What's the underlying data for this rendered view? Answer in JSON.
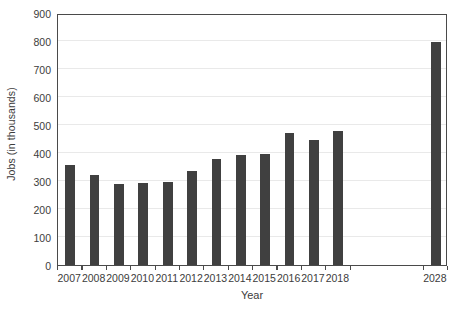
{
  "chart_data": {
    "type": "bar",
    "title": "",
    "subtitle": "",
    "xlabel": "Year",
    "ylabel": "Jobs (in thousands)",
    "categories": [
      "2007",
      "2008",
      "2009",
      "2010",
      "2011",
      "2012",
      "2013",
      "2014",
      "2015",
      "2016",
      "2017",
      "2018",
      "2028"
    ],
    "values": [
      358,
      320,
      291,
      293,
      297,
      337,
      378,
      392,
      398,
      472,
      447,
      478,
      795
    ],
    "series": [
      {
        "name": "Jobs",
        "values": [
          358,
          320,
          291,
          293,
          297,
          337,
          378,
          392,
          398,
          472,
          447,
          478,
          795
        ]
      }
    ],
    "ylim": [
      0,
      900
    ],
    "ytick_values": [
      0,
      100,
      200,
      300,
      400,
      500,
      600,
      700,
      800,
      900
    ],
    "ytick_labels": [
      "0",
      "100",
      "200",
      "300",
      "400",
      "500",
      "600",
      "700",
      "800",
      "900"
    ],
    "grid": true,
    "grid_axis": "y",
    "legend": false,
    "legend_position": "none",
    "bar_color": "#404040",
    "gridline_color": "#e9e9e9",
    "axis_color": "#4a4a4a",
    "background_color": "#ffffff",
    "gap_after_category_index": 11,
    "gap_slots": 3
  }
}
